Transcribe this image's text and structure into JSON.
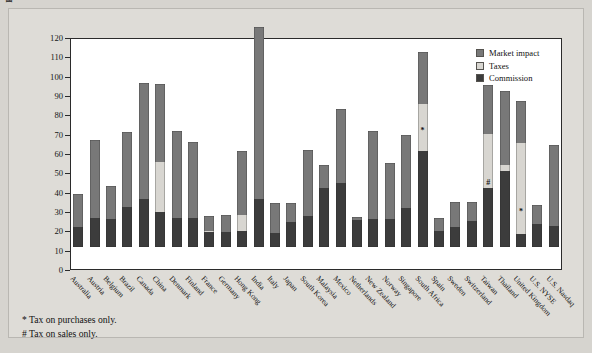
{
  "chart_data": {
    "type": "bar",
    "title": "",
    "subtitle": "",
    "xlabel": "",
    "ylabel": "Basis points of transaction volume",
    "ylim": [
      0,
      120
    ],
    "ytick_step": 10,
    "yticks": [
      0,
      10,
      20,
      30,
      40,
      50,
      60,
      70,
      80,
      90,
      100,
      110,
      120
    ],
    "grid": false,
    "stacked": true,
    "legend_position": "top-right",
    "legend": [
      "Market impact",
      "Taxes",
      "Commission"
    ],
    "colors": {
      "market_impact": "#787878",
      "taxes": "#d8d6d1",
      "commission": "#3c3c3c",
      "frame": "#2b2b2b",
      "plot_background": "#ffffff",
      "page_background": "#dedcd7"
    },
    "categories": [
      "Australia",
      "Austria",
      "Belgium",
      "Brazil",
      "Canada",
      "China",
      "Denmark",
      "Finland",
      "France",
      "Germany",
      "Hong Kong",
      "India",
      "Italy",
      "Japan",
      "South Korea",
      "Malaysia",
      "Mexico",
      "Netherlands",
      "New Zealand",
      "Norway",
      "Singapore",
      "South Africa",
      "Spain",
      "Sweden",
      "Switzerland",
      "Taiwan",
      "Thailand",
      "United Kingdom",
      "U.S. NYSE",
      "U.S. Nasdaq"
    ],
    "series": [
      {
        "name": "Commission",
        "values": [
          10.5,
          15.0,
          14.5,
          20.5,
          25.0,
          18.0,
          15.0,
          15.0,
          8.0,
          8.0,
          8.5,
          25.0,
          7.5,
          13.0,
          16.0,
          30.5,
          33.0,
          14.0,
          14.5,
          14.5,
          20.0,
          49.5,
          8.5,
          10.5,
          13.5,
          30.5,
          39.5,
          6.5,
          12.0,
          11.0
        ]
      },
      {
        "name": "Taxes",
        "values": [
          0,
          0,
          0,
          0,
          0,
          26.0,
          0,
          0,
          0.5,
          0,
          8.0,
          0,
          0,
          0,
          0,
          0,
          0,
          0,
          0,
          0,
          0,
          24.5,
          0,
          0,
          0,
          28.0,
          3.0,
          47.5,
          0,
          0
        ]
      },
      {
        "name": "Market impact",
        "values": [
          17.0,
          40.5,
          17.0,
          39.0,
          60.0,
          40.5,
          45.0,
          39.5,
          7.5,
          8.5,
          33.0,
          89.0,
          15.5,
          10.0,
          34.0,
          12.0,
          38.5,
          1.5,
          45.5,
          29.0,
          38.0,
          27.0,
          6.5,
          13.0,
          10.0,
          25.5,
          38.0,
          21.5,
          9.5,
          42.0
        ]
      }
    ],
    "totals": [
      27.5,
      55.5,
      31.5,
      59.5,
      85.0,
      84.5,
      60.0,
      54.5,
      16.0,
      16.5,
      49.5,
      114.0,
      23.0,
      23.0,
      50.0,
      42.5,
      91.5,
      15.5,
      60.0,
      43.5,
      58.0,
      101.0,
      15.0,
      23.5,
      23.5,
      84.0,
      80.5,
      75.5,
      21.5,
      53.0
    ],
    "annotations": [
      {
        "category": "South Africa",
        "symbol": "*",
        "at_value": 72.0
      },
      {
        "category": "Taiwan",
        "symbol": "#",
        "at_value": 45.0
      },
      {
        "category": "United Kingdom",
        "symbol": "*",
        "at_value": 30.0
      }
    ],
    "footnotes": [
      "* Tax on purchases only.",
      "# Tax on sales only."
    ]
  }
}
